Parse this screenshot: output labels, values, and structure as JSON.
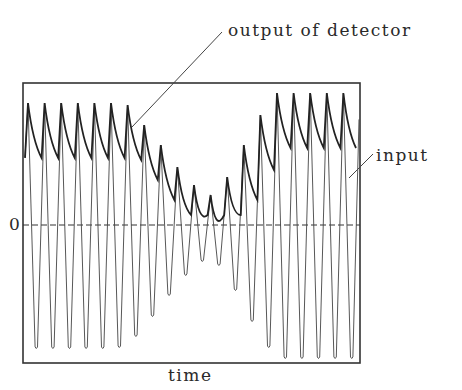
{
  "diagram": {
    "labels": {
      "output": "output of detector",
      "input": "input",
      "zero": "0",
      "xaxis": "time"
    },
    "frame": {
      "x0": 23,
      "y0": 83,
      "x1": 360,
      "y1": 363
    },
    "zero_y": 225,
    "carrier": {
      "cycles": 20,
      "first_peak_x": 28,
      "spacing": 16.6,
      "amplitudes_px": [
        122,
        122,
        122,
        122,
        122,
        122,
        120,
        100,
        80,
        58,
        40,
        30,
        48,
        80,
        110,
        132,
        132,
        132,
        132,
        132,
        132
      ]
    },
    "colors": {
      "line": "#333333",
      "background": "#ffffff"
    }
  }
}
